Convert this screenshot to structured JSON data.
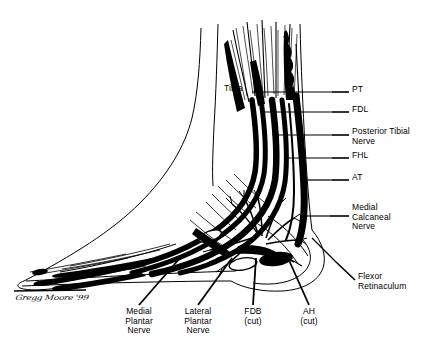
{
  "figure": {
    "kind": "medical-line-art-illustration",
    "background_color": "#ffffff",
    "ink_color": "#000000",
    "signature": "Gregg Moore '99"
  },
  "inline_labels": [
    {
      "id": "tibia",
      "text": "Tibia",
      "x": 224,
      "y": 88,
      "align": "left"
    }
  ],
  "right_labels": [
    {
      "id": "pt",
      "text": "PT",
      "x": 352,
      "y": 89,
      "leader": {
        "x1": 332,
        "y1": 92,
        "x2": 349,
        "y2": 92
      }
    },
    {
      "id": "fdl",
      "text": "FDL",
      "x": 352,
      "y": 109,
      "leader": {
        "x1": 332,
        "y1": 112,
        "x2": 349,
        "y2": 112
      }
    },
    {
      "id": "posterior-tibial-nerve",
      "text": "Posterior Tibial\nNerve",
      "x": 352,
      "y": 131,
      "leader": {
        "x1": 332,
        "y1": 135,
        "x2": 349,
        "y2": 135
      }
    },
    {
      "id": "fhl",
      "text": "FHL",
      "x": 352,
      "y": 155,
      "leader": {
        "x1": 332,
        "y1": 158,
        "x2": 349,
        "y2": 158
      }
    },
    {
      "id": "at",
      "text": "AT",
      "x": 352,
      "y": 177,
      "leader": {
        "x1": 332,
        "y1": 180,
        "x2": 349,
        "y2": 180
      }
    },
    {
      "id": "medial-calcaneal-nerve",
      "text": "Medial\nCalcaneal\nNerve",
      "x": 352,
      "y": 208,
      "leader": {
        "x1": 330,
        "y1": 216,
        "x2": 349,
        "y2": 216
      }
    },
    {
      "id": "flexor-retinaculum",
      "text": "Flexor\nRetinaculum",
      "x": 358,
      "y": 277,
      "leader": {
        "x1": 336,
        "y1": 262,
        "x2": 355,
        "y2": 280
      }
    }
  ],
  "bottom_labels": [
    {
      "id": "medial-plantar-nerve",
      "text": "Medial\nPlantar\nNerve",
      "x": 139,
      "y": 311,
      "leader": {
        "x1": 180,
        "y1": 258,
        "x2": 139,
        "y2": 305
      }
    },
    {
      "id": "lateral-plantar-nerve",
      "text": "Lateral\nPlantar\nNerve",
      "x": 198,
      "y": 311,
      "leader": {
        "x1": 232,
        "y1": 258,
        "x2": 198,
        "y2": 305
      }
    },
    {
      "id": "fdb-cut",
      "text": "FDB\n(cut)",
      "x": 253,
      "y": 311,
      "leader": {
        "x1": 256,
        "y1": 258,
        "x2": 253,
        "y2": 305
      }
    },
    {
      "id": "ah-cut",
      "text": "AH\n(cut)",
      "x": 309,
      "y": 311,
      "leader": {
        "x1": 288,
        "y1": 258,
        "x2": 309,
        "y2": 305
      }
    }
  ],
  "legend_expansions": {
    "PT": "Posterior Tibial tendon",
    "FDL": "Flexor Digitorum Longus",
    "FHL": "Flexor Hallucis Longus",
    "AT": "Achilles Tendon",
    "FDB": "Flexor Digitorum Brevis",
    "AH": "Abductor Hallucis"
  }
}
